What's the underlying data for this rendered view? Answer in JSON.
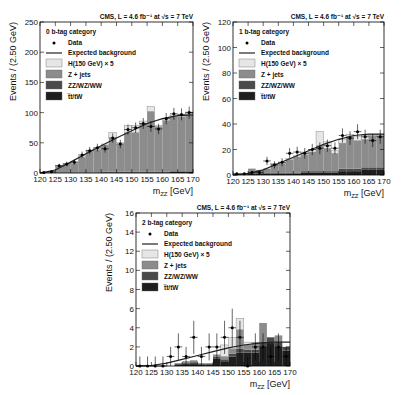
{
  "colors": {
    "higgs": "#e6e6e6",
    "zjets": "#8c8c8c",
    "diboson": "#4a4a4a",
    "ttbar": "#1e1e1e",
    "line": "#222222",
    "frame": "#000000"
  },
  "legend": {
    "data": "Data",
    "expected": "Expected background",
    "higgs": "H(150 GeV) × 5",
    "zjets": "Z + jets",
    "diboson": "ZZ/WZ/WW",
    "ttbar": "t̅t/tW"
  },
  "chart_data": [
    {
      "type": "bar",
      "title": "CMS, L = 4.6 fb⁻¹ at √s = 7 TeV",
      "category_label": "0 b-tag category",
      "xlabel": "m_ZZ [GeV]",
      "ylabel": "Events / (2.50 GeV)",
      "xlim": [
        120,
        170
      ],
      "ylim": [
        0,
        250
      ],
      "xticks": [
        120,
        125,
        130,
        135,
        140,
        145,
        150,
        155,
        160,
        165,
        170
      ],
      "yticks": [
        0,
        50,
        100,
        150,
        200,
        250
      ],
      "bin_edges": [
        120,
        122.5,
        125,
        127.5,
        130,
        132.5,
        135,
        137.5,
        140,
        142.5,
        145,
        147.5,
        150,
        152.5,
        155,
        157.5,
        160,
        162.5,
        165,
        167.5,
        170
      ],
      "series": [
        {
          "name": "t̅t/tW",
          "values": [
            0,
            0,
            0,
            0,
            0,
            0,
            0,
            0,
            1,
            1,
            1,
            1,
            1,
            1,
            1,
            1,
            1,
            2,
            2,
            2
          ]
        },
        {
          "name": "ZZ/WZ/WW",
          "values": [
            0,
            0,
            1,
            1,
            1,
            1,
            1,
            1,
            1,
            1,
            1,
            1,
            1,
            1,
            1,
            1,
            1,
            1,
            1,
            1
          ]
        },
        {
          "name": "Z + jets",
          "values": [
            1,
            3,
            10,
            13,
            15,
            25,
            35,
            38,
            44,
            55,
            45,
            65,
            65,
            80,
            100,
            75,
            85,
            90,
            90,
            95
          ]
        },
        {
          "name": "H(150 GeV) × 5",
          "values": [
            0,
            0,
            1,
            2,
            2,
            2,
            2,
            2,
            2,
            10,
            3,
            12,
            12,
            4,
            8,
            2,
            3,
            3,
            3,
            3
          ]
        }
      ],
      "data_points": {
        "x": [
          121.25,
          123.75,
          126.25,
          128.75,
          131.25,
          133.75,
          136.25,
          138.75,
          141.25,
          143.75,
          146.25,
          148.75,
          151.25,
          153.75,
          156.25,
          158.75,
          161.25,
          163.75,
          166.25,
          168.75
        ],
        "y": [
          1,
          2,
          12,
          15,
          18,
          30,
          37,
          42,
          40,
          58,
          48,
          72,
          75,
          82,
          77,
          73,
          90,
          98,
          97,
          100
        ]
      },
      "expected_background": {
        "x": [
          120,
          125,
          130,
          135,
          140,
          145,
          150,
          155,
          160,
          165,
          170
        ],
        "y": [
          0,
          5,
          18,
          32,
          45,
          58,
          70,
          82,
          90,
          95,
          96
        ]
      }
    },
    {
      "type": "bar",
      "title": "CMS, L = 4.6 fb⁻¹ at √s = 7 TeV",
      "category_label": "1 b-tag category",
      "xlabel": "m_ZZ [GeV]",
      "ylabel": "Events / (2.50 GeV)",
      "xlim": [
        120,
        170
      ],
      "ylim": [
        0,
        120
      ],
      "xticks": [
        120,
        125,
        130,
        135,
        140,
        145,
        150,
        155,
        160,
        165,
        170
      ],
      "yticks": [
        0,
        20,
        40,
        60,
        80,
        100,
        120
      ],
      "bin_edges": [
        120,
        122.5,
        125,
        127.5,
        130,
        132.5,
        135,
        137.5,
        140,
        142.5,
        145,
        147.5,
        150,
        152.5,
        155,
        157.5,
        160,
        162.5,
        165,
        167.5,
        170
      ],
      "series": [
        {
          "name": "t̅t/tW",
          "values": [
            0,
            0,
            1,
            1,
            1,
            1,
            1,
            1,
            1,
            2,
            2,
            2,
            2,
            2,
            3,
            3,
            3,
            4,
            4,
            4
          ]
        },
        {
          "name": "ZZ/WZ/WW",
          "values": [
            0,
            0,
            1,
            1,
            1,
            1,
            1,
            1,
            1,
            1,
            1,
            1,
            1,
            1,
            2,
            2,
            2,
            2,
            2,
            2
          ]
        },
        {
          "name": "Z + jets",
          "values": [
            1,
            1,
            3,
            2,
            3,
            6,
            7,
            10,
            12,
            13,
            15,
            20,
            18,
            14,
            20,
            25,
            22,
            22,
            25,
            25
          ]
        },
        {
          "name": "H(150 GeV) × 5",
          "values": [
            0,
            0,
            0,
            0,
            0,
            1,
            1,
            1,
            1,
            2,
            2,
            11,
            5,
            2,
            3,
            2,
            3,
            3,
            1,
            1
          ]
        }
      ],
      "data_points": {
        "x": [
          121.25,
          123.75,
          126.25,
          128.75,
          131.25,
          133.75,
          136.25,
          138.75,
          141.25,
          143.75,
          146.25,
          148.75,
          151.25,
          153.75,
          156.25,
          158.75,
          161.25,
          163.75,
          166.25,
          168.75
        ],
        "y": [
          1,
          1,
          2,
          2,
          11,
          8,
          10,
          17,
          18,
          17,
          20,
          21,
          23,
          21,
          31,
          29,
          34,
          30,
          27,
          30
        ]
      },
      "expected_background": {
        "x": [
          120,
          125,
          130,
          135,
          140,
          145,
          150,
          155,
          160,
          165,
          170
        ],
        "y": [
          0,
          1,
          4,
          9,
          14,
          19,
          24,
          28,
          31,
          32,
          32
        ]
      }
    },
    {
      "type": "bar",
      "title": "CMS, L = 4.6 fb⁻¹ at √s = 7 TeV",
      "category_label": "2 b-tag category",
      "xlabel": "m_ZZ [GeV]",
      "ylabel": "Events / (2.50 GeV)",
      "xlim": [
        120,
        170
      ],
      "ylim": [
        0,
        16
      ],
      "xticks": [
        120,
        125,
        130,
        135,
        140,
        145,
        150,
        155,
        160,
        165,
        170
      ],
      "yticks": [
        0,
        2,
        4,
        6,
        8,
        10,
        12,
        14,
        16
      ],
      "bin_edges": [
        120,
        122.5,
        125,
        127.5,
        130,
        132.5,
        135,
        137.5,
        140,
        142.5,
        145,
        147.5,
        150,
        152.5,
        155,
        157.5,
        160,
        162.5,
        165,
        167.5,
        170
      ],
      "series": [
        {
          "name": "t̅t/tW",
          "values": [
            0,
            0,
            0,
            0,
            0,
            0.1,
            0.2,
            0.2,
            0.1,
            0.1,
            0.8,
            0.5,
            1.0,
            1.4,
            1.4,
            1.4,
            2.0,
            2.4,
            2.0,
            1.6
          ]
        },
        {
          "name": "ZZ/WZ/WW",
          "values": [
            0,
            0,
            0,
            0,
            0,
            0.1,
            0.1,
            0.2,
            0.1,
            0.1,
            0.2,
            0.2,
            0.3,
            0.4,
            0.3,
            0.3,
            0.5,
            0.6,
            0.5,
            0.4
          ]
        },
        {
          "name": "Z + jets",
          "values": [
            0,
            0,
            0,
            0,
            0,
            0.1,
            0.2,
            0.2,
            0.1,
            0.1,
            0.2,
            0.3,
            0.5,
            2.0,
            0.5,
            0.8,
            2.0,
            0,
            0.7,
            0
          ]
        },
        {
          "name": "H(150 GeV) × 5",
          "values": [
            0,
            0,
            0,
            0,
            0,
            0,
            0,
            0,
            0,
            0,
            0,
            1.2,
            1.2,
            1.2,
            0.3,
            0,
            0,
            0,
            0,
            0
          ]
        }
      ],
      "data_points": {
        "x": [
          121.25,
          123.75,
          126.25,
          128.75,
          131.25,
          133.75,
          136.25,
          138.75,
          141.25,
          143.75,
          146.25,
          148.75,
          151.25,
          153.75,
          156.25,
          158.75,
          161.25,
          163.75,
          166.25,
          168.75
        ],
        "y": [
          0,
          0,
          0,
          0,
          1,
          2,
          1,
          3,
          1,
          2,
          2,
          3,
          4,
          3,
          0,
          2,
          2,
          1,
          2,
          1
        ]
      },
      "expected_background": {
        "x": [
          120,
          125,
          130,
          135,
          140,
          145,
          150,
          155,
          160,
          165,
          170
        ],
        "y": [
          0,
          0.05,
          0.3,
          0.7,
          1.1,
          1.5,
          1.9,
          2.2,
          2.4,
          2.5,
          2.5
        ]
      }
    }
  ]
}
